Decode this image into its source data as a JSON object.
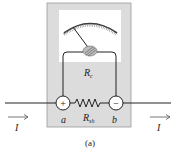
{
  "diagram": {
    "type": "ammeter-with-shunt",
    "labels": {
      "coil_resistance": "R",
      "coil_resistance_sub": "c",
      "shunt_resistance": "R",
      "shunt_resistance_sub": "sh",
      "terminal_a": "a",
      "terminal_b": "b",
      "current_in": "I",
      "current_out": "I",
      "plus_sign": "+",
      "minus_sign": "−",
      "caption": "(a)"
    },
    "colors": {
      "meter_body": "#dcdcdc",
      "dial_face": "#ffffff",
      "wire": "#222222",
      "arrow": "#555555"
    }
  }
}
